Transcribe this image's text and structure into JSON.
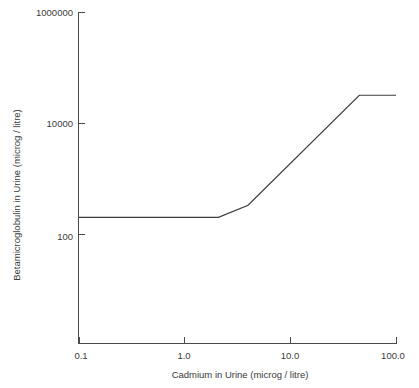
{
  "chart_data": {
    "type": "line",
    "title": "",
    "subtitle": "",
    "xlabel": "Cadmium in Urine (microg / litre)",
    "ylabel": "Betamicroglobulin in Urine (microg / litre)",
    "x_scale": "log",
    "y_scale": "log",
    "xlim": [
      0.1,
      100.0
    ],
    "ylim": [
      1.2,
      1000000
    ],
    "grid": false,
    "legend": null,
    "legend_position": "none",
    "x_ticks": [
      {
        "value": 0.1,
        "label": "0.1"
      },
      {
        "value": 1.0,
        "label": "1.0"
      },
      {
        "value": 10.0,
        "label": "10.0"
      },
      {
        "value": 100.0,
        "label": "100.0"
      }
    ],
    "y_ticks": [
      {
        "value": 1000000,
        "label": "1000000"
      },
      {
        "value": 10000,
        "label": "10000"
      },
      {
        "value": 100,
        "label": "100"
      }
    ],
    "series": [
      {
        "name": "Betamicroglobulin response",
        "color": "#3c3c3c",
        "x": [
          0.1,
          2.1,
          4.0,
          45.0,
          100.0
        ],
        "y": [
          200,
          200,
          330,
          31600,
          31600
        ]
      }
    ],
    "annotations": []
  },
  "axis_titles": {
    "x": "Cadmium in Urine (microg / litre)",
    "y": "Betamicroglobulin in Urine (microg / litre)"
  },
  "tick_labels": {
    "x": [
      "0.1",
      "1.0",
      "10.0",
      "100.0"
    ],
    "y": [
      "1000000",
      "10000",
      "100"
    ]
  },
  "colors": {
    "line": "#3c3c3c",
    "axis": "#4a4a4a",
    "text": "#3a3a3a",
    "background": "#ffffff"
  }
}
